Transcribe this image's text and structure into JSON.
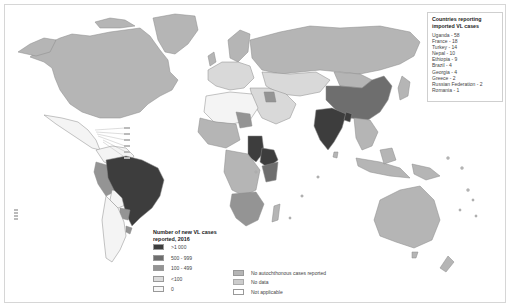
{
  "map": {
    "type": "choropleth",
    "subject": "Number of new VL cases reported, 2016",
    "colors": {
      "gt_1000": "#3d3d3d",
      "500_999": "#6e6e6e",
      "100_499": "#949494",
      "lt_100": "#d9d9d9",
      "zero": "#f4f4f4",
      "no_autochthonous": "#b5b5b5",
      "no_data": "#c8c8c8",
      "not_applicable": "#ffffff",
      "borders": "#888888"
    }
  },
  "imported_cases_legend": {
    "title": "Countries reporting imported VL cases",
    "items": [
      "Uganda - 58",
      "France - 18",
      "Turkey - 14",
      "Nepal - 10",
      "Ethiopia - 9",
      "Brazil - 4",
      "Georgia - 4",
      "Greece - 2",
      "Russian Federation - 2",
      "Romania - 1"
    ]
  },
  "scale_legend": {
    "title": "Number of new VL cases reported, 2016",
    "items": [
      {
        "label": ">1 000",
        "color": "#3d3d3d"
      },
      {
        "label": "500 - 999",
        "color": "#6e6e6e"
      },
      {
        "label": "100 - 499",
        "color": "#949494"
      },
      {
        "label": "<100",
        "color": "#dcdcdc"
      },
      {
        "label": "0",
        "color": "#f7f7f7"
      }
    ]
  },
  "other_legend": {
    "items": [
      {
        "label": "No autochthonous cases reported",
        "color": "#b5b5b5"
      },
      {
        "label": "No data",
        "color": "#cccccc"
      },
      {
        "label": "Not applicable",
        "color": "#ffffff"
      }
    ]
  }
}
